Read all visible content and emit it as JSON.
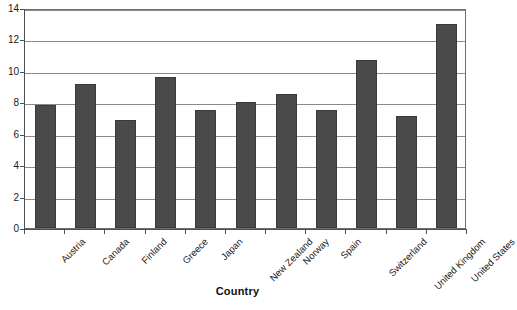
{
  "chart_data": {
    "type": "bar",
    "title": "",
    "xlabel": "Country",
    "ylabel": "",
    "categories": [
      "Austria",
      "Canada",
      "Finland",
      "Greece",
      "Japan",
      "New Zealand",
      "Norway",
      "Spain",
      "Switzerland",
      "United Kingdom",
      "United States"
    ],
    "values": [
      7.8,
      9.15,
      6.9,
      9.6,
      7.5,
      8.0,
      8.5,
      7.5,
      10.7,
      7.1,
      13.0
    ],
    "ylim": [
      0,
      14
    ],
    "ytick_labels": [
      "0",
      "2",
      "4",
      "6",
      "8",
      "10",
      "12",
      "14"
    ],
    "ytick_values": [
      0,
      2,
      4,
      6,
      8,
      10,
      12,
      14
    ],
    "grid": true,
    "legend": false,
    "bar_color": "#4a4a4a",
    "grid_color": "#8a8a8a",
    "axis_color": "#4f4f4f"
  }
}
